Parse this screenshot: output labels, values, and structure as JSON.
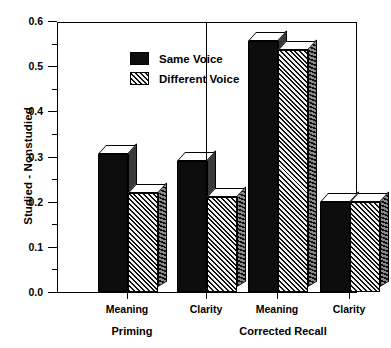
{
  "chart_data": {
    "type": "bar",
    "title": "",
    "xlabel": "",
    "ylabel": "Studied - Nonstudied",
    "ylim": [
      0.0,
      0.6
    ],
    "ytick_labels": [
      "0.0",
      "0.1",
      "0.2",
      "0.3",
      "0.4",
      "0.5",
      "0.6"
    ],
    "ytick_values": [
      0.0,
      0.1,
      0.2,
      0.3,
      0.4,
      0.5,
      0.6
    ],
    "yminor_values": [
      0.05,
      0.15,
      0.25,
      0.35,
      0.45,
      0.55
    ],
    "grid": false,
    "legend_position": "top-left",
    "panels": [
      "Priming",
      "Corrected Recall"
    ],
    "categories": [
      "Meaning",
      "Clarity",
      "Meaning",
      "Clarity"
    ],
    "series": [
      {
        "name": "Same Voice",
        "fill": "solid",
        "values": [
          0.305,
          0.29,
          0.555,
          0.2
        ]
      },
      {
        "name": "Different Voice",
        "fill": "hatch",
        "values": [
          0.22,
          0.21,
          0.535,
          0.2
        ]
      }
    ],
    "colors": {
      "same_voice": "#0d0d0d",
      "different_voice": "#8a8a8a",
      "axis": "#000000",
      "background": "#ffffff"
    }
  },
  "axis": {
    "y_title": "Studied - Nonstudied",
    "ticks": [
      {
        "label": "0.6",
        "value": 0.6
      },
      {
        "label": "0.5",
        "value": 0.5
      },
      {
        "label": "0.4",
        "value": 0.4
      },
      {
        "label": "0.3",
        "value": 0.3
      },
      {
        "label": "0.2",
        "value": 0.2
      },
      {
        "label": "0.1",
        "value": 0.1
      },
      {
        "label": "0.0",
        "value": 0.0
      }
    ]
  },
  "legend": {
    "items": [
      {
        "label": "Same Voice",
        "swatch": "solid-swatch-icon"
      },
      {
        "label": "Different Voice",
        "swatch": "hatch-swatch-icon"
      }
    ]
  },
  "xaxis": {
    "categories": [
      {
        "label": "Meaning"
      },
      {
        "label": "Clarity"
      },
      {
        "label": "Meaning"
      },
      {
        "label": "Clarity"
      }
    ],
    "groups": [
      {
        "label": "Priming"
      },
      {
        "label": "Corrected Recall"
      }
    ]
  }
}
